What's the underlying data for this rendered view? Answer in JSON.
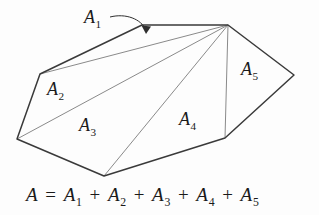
{
  "figure": {
    "background_color": "#fdfdfd",
    "stroke_color": "#333333",
    "inner_stroke_color": "#808080",
    "text_color": "#1a1a1a",
    "outline": {
      "name": "heptagon-outline",
      "points": "142,25 228,25 294,75 225,138 104,176 17,139 40,74",
      "vertices": [
        {
          "name": "top-left-of-top-edge",
          "x": 142,
          "y": 25
        },
        {
          "name": "apex-top-right",
          "x": 228,
          "y": 25
        },
        {
          "name": "right",
          "x": 294,
          "y": 75
        },
        {
          "name": "bottom-right",
          "x": 225,
          "y": 138
        },
        {
          "name": "bottom",
          "x": 104,
          "y": 176
        },
        {
          "name": "left",
          "x": 17,
          "y": 139
        },
        {
          "name": "upper-left",
          "x": 40,
          "y": 74
        }
      ]
    },
    "diagonals": [
      {
        "name": "diagonal-apex-to-upper-left",
        "x1": 228,
        "y1": 25,
        "x2": 40,
        "y2": 74
      },
      {
        "name": "diagonal-apex-to-left",
        "x1": 228,
        "y1": 25,
        "x2": 17,
        "y2": 139
      },
      {
        "name": "diagonal-apex-to-bottom",
        "x1": 228,
        "y1": 25,
        "x2": 104,
        "y2": 176
      },
      {
        "name": "diagonal-apex-to-bottom-right",
        "x1": 228,
        "y1": 25,
        "x2": 225,
        "y2": 138
      }
    ],
    "leader": {
      "name": "a1-leader-arrow",
      "path": "M 110,17 C 126,14 140,20 146,31",
      "arrow_tip_x": 146,
      "arrow_tip_y": 32
    },
    "labels": {
      "a1": {
        "base": "A",
        "sub": "1"
      },
      "a2": {
        "base": "A",
        "sub": "2"
      },
      "a3": {
        "base": "A",
        "sub": "3"
      },
      "a4": {
        "base": "A",
        "sub": "4"
      },
      "a5": {
        "base": "A",
        "sub": "5"
      }
    },
    "equation": {
      "lhs": "A",
      "equals": " = ",
      "terms": [
        {
          "base": "A",
          "sub": "1"
        },
        {
          "base": "A",
          "sub": "2"
        },
        {
          "base": "A",
          "sub": "3"
        },
        {
          "base": "A",
          "sub": "4"
        },
        {
          "base": "A",
          "sub": "5"
        }
      ],
      "operator": " + ",
      "full_text": "A = A1 + A2 + A3 + A4 + A5"
    }
  }
}
